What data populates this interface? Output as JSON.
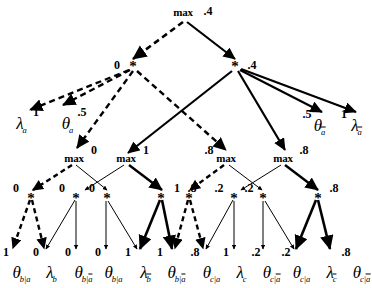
{
  "figure": {
    "type": "computation-graph",
    "legend": {
      "dashed_edge": "dashed arrow",
      "solid_edge": "solid arrow",
      "thick_edge": "bold solid arrow"
    }
  },
  "nodes": {
    "root": {
      "op": "max",
      "value": ".4"
    },
    "level2": [
      {
        "op": "*",
        "value": "0",
        "value_side": "left"
      },
      {
        "op": "*",
        "value": ".4",
        "value_side": "right"
      }
    ],
    "level3_max": [
      {
        "op": "max",
        "value": "0",
        "value_side": "right"
      },
      {
        "op": "max",
        "value": "1",
        "value_side": "right"
      },
      {
        "op": "max",
        "value": ".8",
        "value_side": "left"
      },
      {
        "op": "max",
        "value": ".8",
        "value_side": "right"
      }
    ],
    "level4_star": [
      {
        "op": "*",
        "value": "0"
      },
      {
        "op": "*",
        "value": "0"
      },
      {
        "op": "*",
        "value": "0"
      },
      {
        "op": "*",
        "value": "1"
      },
      {
        "op": "*",
        "value": ".8"
      },
      {
        "op": "*",
        "value": ".2"
      },
      {
        "op": "*",
        "value": ".2"
      },
      {
        "op": "*",
        "value": ".8"
      }
    ]
  },
  "indicator_leaves": [
    {
      "symbol": "λ",
      "sub": "a",
      "overbar": false,
      "value": "1"
    },
    {
      "symbol": "θ",
      "sub": "a",
      "overbar": false,
      "value": ".5"
    },
    {
      "symbol": "θ",
      "sub": "a",
      "overbar": true,
      "value": ".5"
    },
    {
      "symbol": "λ",
      "sub": "a",
      "overbar": true,
      "value": "1"
    }
  ],
  "bottom_leaves": [
    {
      "symbol": "θ",
      "sub": "b|a",
      "sub_overbar": "",
      "value": "1"
    },
    {
      "symbol": "λ",
      "sub": "b",
      "sub_overbar": "",
      "value": "0"
    },
    {
      "symbol": "θ",
      "sub": "b|",
      "sub_overbar": "a",
      "value": "0"
    },
    {
      "symbol": "θ",
      "sub": "b|a",
      "sub_overbar": "",
      "value": "0"
    },
    {
      "symbol": "λ",
      "sub": "",
      "sub_overbar": "b",
      "value": "1"
    },
    {
      "symbol": "θ",
      "sub": "b|",
      "sub_overbar": "a",
      "value": "1"
    },
    {
      "symbol": "θ",
      "sub": "c|a",
      "sub_overbar": "",
      "value": ".8"
    },
    {
      "symbol": "λ",
      "sub": "c",
      "sub_overbar": "",
      "value": "1"
    },
    {
      "symbol": "θ",
      "sub": "c|",
      "sub_overbar": "a",
      "value": ".2"
    },
    {
      "symbol": "θ",
      "sub": "c|a",
      "sub_overbar": "",
      "value": ".2"
    },
    {
      "symbol": "λ",
      "sub": "",
      "sub_overbar": "c",
      "value": ""
    },
    {
      "symbol": "θ",
      "sub": "c|",
      "sub_overbar": "a",
      "value": ".8"
    }
  ],
  "colors": {
    "ink": "#000000",
    "background": "#ffffff"
  }
}
